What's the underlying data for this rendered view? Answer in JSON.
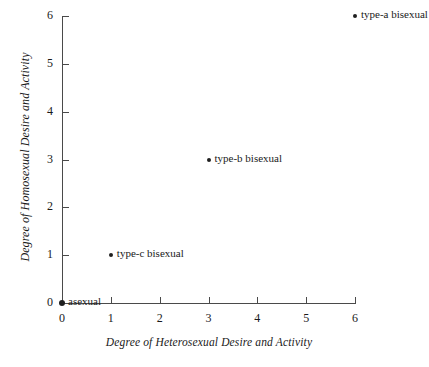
{
  "chart_data": {
    "type": "scatter",
    "title": "",
    "xlabel": "Degree of Heterosexual Desire and Activity",
    "ylabel": "Degree of Homosexual Desire and Activity",
    "xlim": [
      0,
      6
    ],
    "ylim": [
      0,
      6
    ],
    "xticks": [
      "0",
      "1",
      "2",
      "3",
      "4",
      "5",
      "6"
    ],
    "yticks": [
      "0",
      "1",
      "2",
      "3",
      "4",
      "5",
      "6"
    ],
    "grid": false,
    "legend": "none",
    "points": [
      {
        "label": "asexual",
        "x": 0,
        "y": 0,
        "marker": "dot-large"
      },
      {
        "label": "type-c bisexual",
        "x": 1,
        "y": 1,
        "marker": "dot"
      },
      {
        "label": "type-b bisexual",
        "x": 3,
        "y": 3,
        "marker": "dot"
      },
      {
        "label": "type-a bisexual",
        "x": 6,
        "y": 6,
        "marker": "dot"
      }
    ],
    "marker_color": "#1f1f1f",
    "axis_color": "#4a4a4a",
    "background_color": "#ffffff"
  }
}
